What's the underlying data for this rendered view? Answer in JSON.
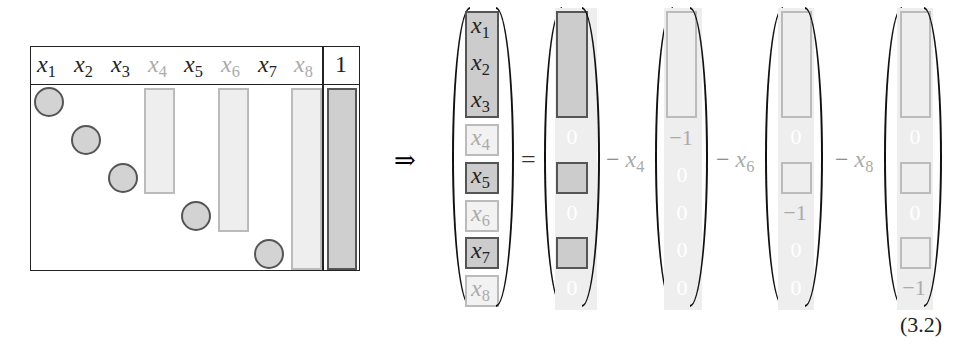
{
  "table": {
    "headers": [
      {
        "label": "x",
        "sub": "1",
        "tone": "dark"
      },
      {
        "label": "x",
        "sub": "2",
        "tone": "dark"
      },
      {
        "label": "x",
        "sub": "3",
        "tone": "dark"
      },
      {
        "label": "x",
        "sub": "4",
        "tone": "light"
      },
      {
        "label": "x",
        "sub": "5",
        "tone": "dark"
      },
      {
        "label": "x",
        "sub": "6",
        "tone": "light"
      },
      {
        "label": "x",
        "sub": "7",
        "tone": "dark"
      },
      {
        "label": "x",
        "sub": "8",
        "tone": "light"
      }
    ],
    "rhs_header": "1"
  },
  "implies": "⇒",
  "equals": "=",
  "solution_vector": [
    {
      "label": "x",
      "sub": "1"
    },
    {
      "label": "x",
      "sub": "2"
    },
    {
      "label": "x",
      "sub": "3"
    },
    {
      "label": "x",
      "sub": "4"
    },
    {
      "label": "x",
      "sub": "5"
    },
    {
      "label": "x",
      "sub": "6"
    },
    {
      "label": "x",
      "sub": "7"
    },
    {
      "label": "x",
      "sub": "8"
    }
  ],
  "terms": [
    {
      "op": "−",
      "var": "x",
      "sub": "4",
      "minus_one": "−1"
    },
    {
      "op": "−",
      "var": "x",
      "sub": "6",
      "minus_one": "−1"
    },
    {
      "op": "−",
      "var": "x",
      "sub": "8",
      "minus_one": "−1"
    }
  ],
  "zero": "0",
  "equation_number": "(3.2)"
}
